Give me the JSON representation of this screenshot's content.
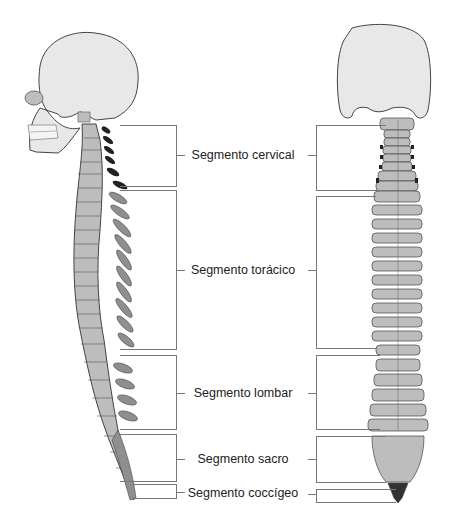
{
  "diagram": {
    "views": [
      "lateral",
      "posterior"
    ],
    "segments": [
      {
        "id": "cervical",
        "label": "Segmento cervical",
        "left": {
          "top": 125,
          "bottom": 187
        },
        "right": {
          "top": 125,
          "bottom": 191
        },
        "label_y": 155
      },
      {
        "id": "toracico",
        "label": "Segmento torácico",
        "left": {
          "top": 190,
          "bottom": 350
        },
        "right": {
          "top": 196,
          "bottom": 349
        },
        "label_y": 270
      },
      {
        "id": "lombar",
        "label": "Segmento lombar",
        "left": {
          "top": 355,
          "bottom": 430
        },
        "right": {
          "top": 355,
          "bottom": 430
        },
        "label_y": 393
      },
      {
        "id": "sacro",
        "label": "Segmento sacro",
        "left": {
          "top": 434,
          "bottom": 482
        },
        "right": {
          "top": 436,
          "bottom": 483
        },
        "label_y": 459
      },
      {
        "id": "coccigeo",
        "label": "Segmento coccígeo",
        "left": {
          "top": 484,
          "bottom": 499
        },
        "right": {
          "top": 489,
          "bottom": 503
        },
        "label_y": 494
      }
    ],
    "colors": {
      "bone": "#bdbdbd",
      "bone_dark": "#8f8f8f",
      "skull": "#e8e8e8",
      "outline": "#444444",
      "cervical_process": "#222222",
      "bracket": "#777777"
    }
  }
}
